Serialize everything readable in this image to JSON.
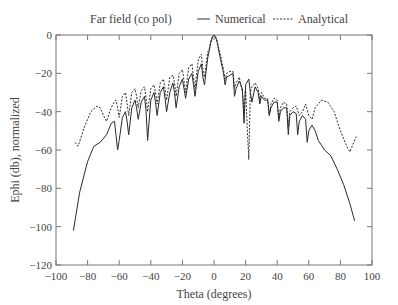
{
  "chart_data": {
    "type": "line",
    "title": "Far field (co pol)",
    "xlabel": "Theta (degrees)",
    "ylabel": "Ephi (db), normalized",
    "xlim": [
      -100,
      100
    ],
    "ylim": [
      -120,
      0
    ],
    "xticks": [
      -100,
      -80,
      -60,
      -40,
      -20,
      0,
      20,
      40,
      60,
      80,
      100
    ],
    "yticks": [
      0,
      -20,
      -40,
      -60,
      -80,
      -100,
      -120
    ],
    "xtick_labels": [
      "−100",
      "−80",
      "−60",
      "−40",
      "−20",
      "0",
      "20",
      "40",
      "60",
      "80",
      "100"
    ],
    "ytick_labels": [
      "0",
      "−20",
      "−40",
      "−60",
      "−80",
      "−100",
      "−120"
    ],
    "grid": false,
    "legend_position": "top",
    "series": [
      {
        "name": "Numerical",
        "style": "solid",
        "x": [
          -89,
          -85,
          -80,
          -76,
          -72,
          -68,
          -65,
          -63,
          -61,
          -60,
          -58,
          -56,
          -55,
          -54,
          -52,
          -50,
          -49,
          -48,
          -46,
          -44,
          -43,
          -42,
          -40,
          -38,
          -37,
          -36,
          -34,
          -32,
          -31,
          -30,
          -28,
          -26,
          -25,
          -24,
          -22,
          -20,
          -19,
          -18,
          -16,
          -14,
          -13,
          -12,
          -10,
          -8,
          -7,
          -6,
          -4,
          -3,
          -2,
          -1,
          0,
          1,
          2,
          3,
          4,
          6,
          7,
          8,
          10,
          12,
          13,
          14,
          16,
          18,
          19,
          20,
          22,
          23,
          24,
          26,
          28,
          29,
          30,
          32,
          34,
          35,
          36,
          38,
          40,
          41,
          42,
          44,
          46,
          47,
          48,
          50,
          52,
          53,
          54,
          56,
          58,
          59,
          60,
          62,
          64,
          66,
          70,
          74,
          78,
          82,
          86,
          89
        ],
        "y": [
          -102,
          -82,
          -66,
          -58,
          -56,
          -52,
          -46,
          -45,
          -60,
          -55,
          -43,
          -40,
          -45,
          -52,
          -38,
          -34,
          -38,
          -44,
          -35,
          -32,
          -40,
          -55,
          -34,
          -30,
          -35,
          -42,
          -30,
          -27,
          -33,
          -40,
          -30,
          -25,
          -30,
          -38,
          -27,
          -23,
          -28,
          -33,
          -23,
          -20,
          -26,
          -32,
          -19,
          -15,
          -22,
          -26,
          -12,
          -8,
          -4,
          -1,
          0,
          -1,
          -4,
          -8,
          -12,
          -20,
          -26,
          -22,
          -21,
          -20,
          -32,
          -28,
          -24,
          -28,
          -46,
          -26,
          -23,
          -30,
          -35,
          -27,
          -30,
          -36,
          -32,
          -34,
          -34,
          -42,
          -38,
          -35,
          -35,
          -45,
          -40,
          -38,
          -38,
          -52,
          -42,
          -40,
          -41,
          -52,
          -45,
          -42,
          -44,
          -56,
          -50,
          -47,
          -50,
          -55,
          -60,
          -63,
          -70,
          -78,
          -88,
          -97
        ]
      },
      {
        "name": "Analytical",
        "style": "dashed",
        "x": [
          -88,
          -86,
          -82,
          -78,
          -74,
          -72,
          -70,
          -68,
          -66,
          -64,
          -62,
          -61,
          -60,
          -58,
          -56,
          -55,
          -54,
          -52,
          -50,
          -49,
          -48,
          -46,
          -44,
          -43,
          -42,
          -40,
          -38,
          -37,
          -36,
          -34,
          -32,
          -31,
          -30,
          -28,
          -26,
          -25,
          -24,
          -22,
          -20,
          -19,
          -18,
          -16,
          -14,
          -13,
          -12,
          -10,
          -8,
          -7,
          -6,
          -4,
          -3,
          -2,
          -1,
          0,
          1,
          2,
          3,
          4,
          6,
          7,
          8,
          10,
          12,
          13,
          14,
          16,
          18,
          19,
          20,
          21,
          22,
          23,
          24,
          26,
          28,
          29,
          30,
          32,
          34,
          35,
          36,
          38,
          40,
          41,
          42,
          44,
          46,
          47,
          48,
          50,
          52,
          54,
          56,
          58,
          60,
          62,
          64,
          68,
          72,
          76,
          80,
          84,
          86,
          88,
          90
        ],
        "y": [
          -56,
          -58,
          -48,
          -40,
          -37,
          -38,
          -42,
          -45,
          -40,
          -36,
          -34,
          -38,
          -43,
          -32,
          -30,
          -36,
          -42,
          -30,
          -28,
          -32,
          -38,
          -29,
          -27,
          -33,
          -40,
          -28,
          -26,
          -30,
          -36,
          -25,
          -23,
          -28,
          -34,
          -22,
          -21,
          -25,
          -32,
          -20,
          -18,
          -24,
          -30,
          -17,
          -15,
          -22,
          -28,
          -13,
          -10,
          -18,
          -22,
          -9,
          -7,
          -3,
          -1,
          0,
          -1,
          -3,
          -7,
          -10,
          -18,
          -23,
          -20,
          -19,
          -19,
          -28,
          -25,
          -22,
          -30,
          -40,
          -28,
          -48,
          -65,
          -30,
          -27,
          -25,
          -28,
          -34,
          -30,
          -33,
          -33,
          -42,
          -36,
          -33,
          -34,
          -44,
          -38,
          -35,
          -36,
          -48,
          -40,
          -38,
          -37,
          -42,
          -40,
          -36,
          -42,
          -44,
          -38,
          -34,
          -35,
          -40,
          -50,
          -58,
          -61,
          -57,
          -53
        ]
      }
    ]
  },
  "legend": {
    "title": "Far field (co pol)",
    "items": [
      {
        "label": "Numerical",
        "style": "solid"
      },
      {
        "label": "Analytical",
        "style": "dashed"
      }
    ]
  },
  "axes": {
    "xlabel": "Theta (degrees)",
    "ylabel": "Ephi (db), normalized"
  },
  "colors": {
    "line": "#2a2a2a",
    "axis": "#666666",
    "text": "#444444"
  }
}
